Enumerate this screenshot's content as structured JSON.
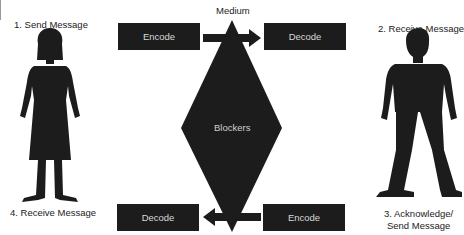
{
  "diagram": {
    "medium_label": "Medium",
    "center_label": "Blockers",
    "steps": {
      "send": "1. Send Message",
      "receive": "2. Receive Message",
      "acknowledge_line1": "3. Acknowledge/",
      "acknowledge_line2": "Send Message",
      "receive_back": "4. Receive Message"
    },
    "top_row": {
      "left_box": "Encode",
      "right_box": "Decode",
      "arrow_direction": "right"
    },
    "bottom_row": {
      "left_box": "Decode",
      "right_box": "Encode",
      "arrow_direction": "left"
    },
    "figures": [
      {
        "id": "sender",
        "type": "woman-silhouette"
      },
      {
        "id": "receiver",
        "type": "man-silhouette"
      }
    ],
    "colors": {
      "shape_fill": "#1c1c1c",
      "box_text": "#d8d8d8",
      "background": "#ffffff"
    }
  }
}
